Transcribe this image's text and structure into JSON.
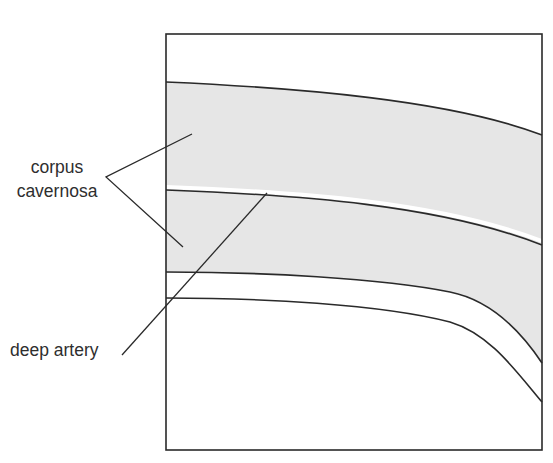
{
  "diagram": {
    "type": "anatomical cross-section schematic",
    "labels": {
      "corpus_line1": "corpus",
      "corpus_line2": "cavernosa",
      "deep_artery": "deep artery"
    },
    "regions": [
      {
        "name": "corpus cavernosa (upper)",
        "fill": "#e6e6e6"
      },
      {
        "name": "corpus cavernosa (lower)",
        "fill": "#e6e6e6"
      },
      {
        "name": "deep artery",
        "fill": "#ffffff"
      }
    ],
    "colors": {
      "shading": "#e6e6e6",
      "line": "#2a2a2a",
      "text": "#2e2e2e",
      "background": "#ffffff"
    }
  }
}
